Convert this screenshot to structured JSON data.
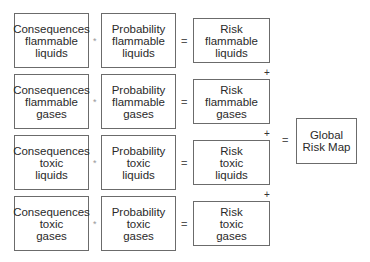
{
  "rows": [
    {
      "consequences": [
        "Consequences",
        "flammable",
        "liquids"
      ],
      "probability": [
        "Probability",
        "flammable",
        "liquids"
      ],
      "risk": [
        "Risk",
        "flammable",
        "liquids"
      ]
    },
    {
      "consequences": [
        "Consequences",
        "flammable",
        "gases"
      ],
      "probability": [
        "Probability",
        "flammable",
        "gases"
      ],
      "risk": [
        "Risk",
        "flammable",
        "gases"
      ]
    },
    {
      "consequences": [
        "Consequences",
        "toxic",
        "liquids"
      ],
      "probability": [
        "Probability",
        "toxic",
        "liquids"
      ],
      "risk": [
        "Risk",
        "toxic",
        "liquids"
      ]
    },
    {
      "consequences": [
        "Consequences",
        "toxic",
        "gases"
      ],
      "probability": [
        "Probability",
        "toxic",
        "gases"
      ],
      "risk": [
        "Risk",
        "toxic",
        "gases"
      ]
    }
  ],
  "operators": {
    "multiply": "*",
    "equals": "=",
    "plus": "+"
  },
  "global": [
    "Global",
    "Risk Map"
  ]
}
